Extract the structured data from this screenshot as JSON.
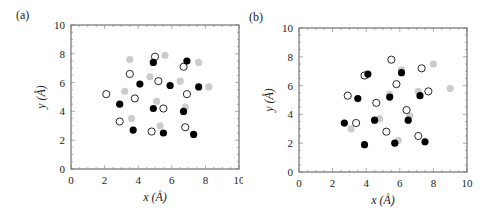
{
  "chart_data": [
    {
      "panel": "(a)",
      "type": "scatter",
      "title": "",
      "xlabel": "x (Å)",
      "ylabel": "y (Å)",
      "xlim": [
        0,
        10
      ],
      "ylim": [
        0,
        10
      ],
      "xticks": [
        0,
        2,
        4,
        6,
        8,
        10
      ],
      "yticks": [
        0,
        2,
        4,
        6,
        8,
        10
      ],
      "grid": false,
      "legend": null,
      "series": [
        {
          "name": "filled-black",
          "marker": "filled",
          "color": "#000000",
          "points": [
            [
              4.9,
              7.4
            ],
            [
              6.9,
              7.5
            ],
            [
              4.1,
              5.9
            ],
            [
              5.9,
              5.8
            ],
            [
              7.6,
              5.7
            ],
            [
              2.9,
              4.5
            ],
            [
              4.9,
              4.2
            ],
            [
              6.7,
              4.0
            ],
            [
              3.7,
              2.7
            ],
            [
              5.5,
              2.5
            ],
            [
              7.3,
              2.4
            ]
          ]
        },
        {
          "name": "open-circle",
          "marker": "open",
          "color": "#000000",
          "points": [
            [
              5.0,
              7.8
            ],
            [
              6.7,
              7.1
            ],
            [
              3.5,
              6.6
            ],
            [
              5.2,
              6.1
            ],
            [
              2.1,
              5.2
            ],
            [
              3.8,
              4.9
            ],
            [
              6.9,
              5.2
            ],
            [
              5.5,
              4.2
            ],
            [
              2.9,
              3.3
            ],
            [
              4.8,
              2.6
            ],
            [
              6.8,
              2.9
            ]
          ]
        },
        {
          "name": "gray-filled",
          "marker": "filled",
          "color": "#cccccc",
          "points": [
            [
              3.5,
              7.6
            ],
            [
              5.6,
              7.9
            ],
            [
              7.6,
              7.4
            ],
            [
              4.7,
              6.4
            ],
            [
              6.5,
              6.1
            ],
            [
              3.2,
              5.4
            ],
            [
              8.2,
              5.7
            ],
            [
              5.1,
              4.7
            ],
            [
              6.8,
              4.3
            ],
            [
              3.6,
              3.5
            ],
            [
              5.3,
              3.0
            ]
          ]
        }
      ]
    },
    {
      "panel": "(b)",
      "type": "scatter",
      "title": "",
      "xlabel": "x (Å)",
      "ylabel": "y (Å)",
      "xlim": [
        0,
        10
      ],
      "ylim": [
        0,
        10
      ],
      "xticks": [
        0,
        2,
        4,
        6,
        8,
        10
      ],
      "yticks": [
        0,
        2,
        4,
        6,
        8,
        10
      ],
      "grid": false,
      "legend": null,
      "series": [
        {
          "name": "filled-black",
          "marker": "filled",
          "color": "#000000",
          "points": [
            [
              4.1,
              6.8
            ],
            [
              6.1,
              6.9
            ],
            [
              3.5,
              5.1
            ],
            [
              5.4,
              5.2
            ],
            [
              7.2,
              5.3
            ],
            [
              2.7,
              3.4
            ],
            [
              4.5,
              3.6
            ],
            [
              6.5,
              3.6
            ],
            [
              3.9,
              1.9
            ],
            [
              5.7,
              2.0
            ],
            [
              7.5,
              2.1
            ]
          ]
        },
        {
          "name": "open-circle",
          "marker": "open",
          "color": "#000000",
          "points": [
            [
              5.5,
              7.8
            ],
            [
              7.3,
              7.2
            ],
            [
              3.9,
              6.7
            ],
            [
              5.8,
              6.1
            ],
            [
              2.9,
              5.3
            ],
            [
              4.6,
              4.8
            ],
            [
              7.7,
              5.6
            ],
            [
              6.4,
              4.3
            ],
            [
              3.4,
              3.4
            ],
            [
              5.2,
              2.8
            ],
            [
              7.1,
              2.5
            ]
          ]
        },
        {
          "name": "gray-filled",
          "marker": "filled",
          "color": "#cccccc",
          "points": [
            [
              8.0,
              7.5
            ],
            [
              6.1,
              7.1
            ],
            [
              5.4,
              5.4
            ],
            [
              7.1,
              5.6
            ],
            [
              9.0,
              5.8
            ],
            [
              4.8,
              3.7
            ],
            [
              6.6,
              3.9
            ],
            [
              3.1,
              3.0
            ],
            [
              5.9,
              2.2
            ],
            [
              4.0,
              6.7
            ]
          ]
        }
      ]
    }
  ],
  "panels": [
    {
      "label": "(a)",
      "xlabel": "x (Å)",
      "ylabel": "y (Å)"
    },
    {
      "label": "(b)",
      "xlabel": "x (Å)",
      "ylabel": "y (Å)"
    }
  ]
}
